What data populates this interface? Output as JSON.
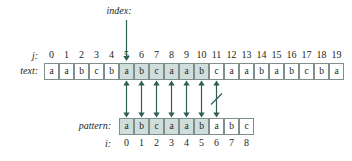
{
  "diagram": {
    "title_pointer": {
      "label": "index:",
      "points_to_index": 5
    },
    "labels": {
      "text_row": "text:",
      "pattern_row": "pattern:",
      "text_index": "j:",
      "pattern_index": "i:"
    },
    "text": {
      "indices": [
        "0",
        "1",
        "2",
        "3",
        "4",
        "5",
        "6",
        "7",
        "8",
        "9",
        "10",
        "11",
        "12",
        "13",
        "14",
        "15",
        "16",
        "17",
        "18",
        "19"
      ],
      "chars": [
        "a",
        "a",
        "b",
        "c",
        "b",
        "a",
        "b",
        "c",
        "a",
        "a",
        "b",
        "c",
        "a",
        "a",
        "b",
        "a",
        "b",
        "c",
        "b",
        "a"
      ],
      "highlighted": [
        false,
        false,
        false,
        false,
        false,
        true,
        true,
        true,
        true,
        true,
        true,
        false,
        false,
        false,
        false,
        false,
        false,
        false,
        false,
        false
      ]
    },
    "pattern": {
      "indices": [
        "0",
        "1",
        "2",
        "3",
        "4",
        "5",
        "6",
        "7",
        "8"
      ],
      "chars": [
        "a",
        "b",
        "c",
        "a",
        "a",
        "b",
        "a",
        "b",
        "c"
      ],
      "highlighted": [
        true,
        true,
        true,
        true,
        true,
        true,
        false,
        false,
        false
      ],
      "start_text_index": 5
    },
    "comparisons": [
      {
        "text_index": 5,
        "pattern_index": 0,
        "result": "match"
      },
      {
        "text_index": 6,
        "pattern_index": 1,
        "result": "match"
      },
      {
        "text_index": 7,
        "pattern_index": 2,
        "result": "match"
      },
      {
        "text_index": 8,
        "pattern_index": 3,
        "result": "match"
      },
      {
        "text_index": 9,
        "pattern_index": 4,
        "result": "match"
      },
      {
        "text_index": 10,
        "pattern_index": 5,
        "result": "match"
      },
      {
        "text_index": 11,
        "pattern_index": 6,
        "result": "mismatch"
      }
    ],
    "colors": {
      "ink": "#231f20",
      "cell_border": "#7e8f8c",
      "cell_highlight": "#cfdddb",
      "arrow": "#2f5d57",
      "background": "#ffffff"
    }
  }
}
